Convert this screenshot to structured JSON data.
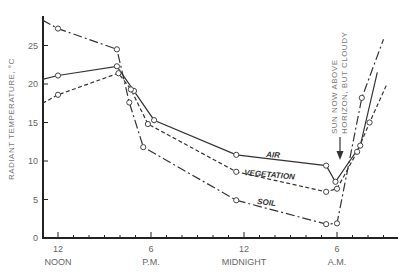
{
  "chart_data": {
    "type": "line",
    "title": "",
    "xlabel": "",
    "ylabel": "RADIANT TEMPERATURE, °C",
    "ylim": [
      0,
      29
    ],
    "y_ticks": [
      0,
      5,
      10,
      15,
      20,
      25
    ],
    "x_unit": "hours after noon",
    "x_ticks": [
      {
        "h": 0,
        "label": "12",
        "sublabel": "NOON"
      },
      {
        "h": 6,
        "label": "6",
        "sublabel": "P.M."
      },
      {
        "h": 12,
        "label": "12",
        "sublabel": "MIDNIGHT"
      },
      {
        "h": 18,
        "label": "6",
        "sublabel": "A.M."
      }
    ],
    "xlim": [
      -1,
      22
    ],
    "grid": false,
    "annotation": {
      "lines": [
        "SUN NOW ABOVE",
        "HORIZON, BUT CLOUDY"
      ],
      "points_to_h": 17.3
    },
    "series": [
      {
        "name": "AIR",
        "style": "solid",
        "x": [
          -1.0,
          0.0,
          3.8,
          4.9,
          6.2,
          11.5,
          17.3,
          17.9,
          19.5,
          20.6
        ],
        "values": [
          20.6,
          21.1,
          22.3,
          19.1,
          15.3,
          10.8,
          9.4,
          7.3,
          12.0,
          21.5
        ],
        "markers": [
          false,
          true,
          true,
          true,
          true,
          true,
          true,
          true,
          true,
          false
        ]
      },
      {
        "name": "VEGETATION",
        "style": "dashed",
        "x": [
          -1.0,
          0.0,
          3.9,
          4.7,
          5.8,
          11.5,
          17.3,
          18.0,
          19.3,
          20.1,
          21.2
        ],
        "values": [
          17.5,
          18.6,
          21.4,
          19.3,
          14.8,
          8.6,
          6.0,
          6.4,
          11.2,
          15.0,
          19.9
        ],
        "markers": [
          false,
          true,
          true,
          true,
          true,
          true,
          true,
          true,
          true,
          true,
          false
        ]
      },
      {
        "name": "SOIL",
        "style": "dash-dot",
        "x": [
          -1.0,
          0.0,
          3.8,
          4.6,
          5.5,
          11.5,
          17.3,
          18.0,
          19.6,
          21.0
        ],
        "values": [
          28.3,
          27.2,
          24.5,
          17.6,
          11.8,
          4.9,
          1.8,
          1.9,
          18.2,
          25.8
        ],
        "markers": [
          false,
          true,
          true,
          true,
          true,
          true,
          true,
          true,
          true,
          false
        ]
      }
    ]
  },
  "labels": {
    "air": "AIR",
    "vegetation": "VEGETATION",
    "soil": "SOIL",
    "ylabel": "RADIANT TEMPERATURE, °C",
    "annotation_1": "SUN NOW ABOVE",
    "annotation_2": "HORIZON, BUT CLOUDY"
  }
}
